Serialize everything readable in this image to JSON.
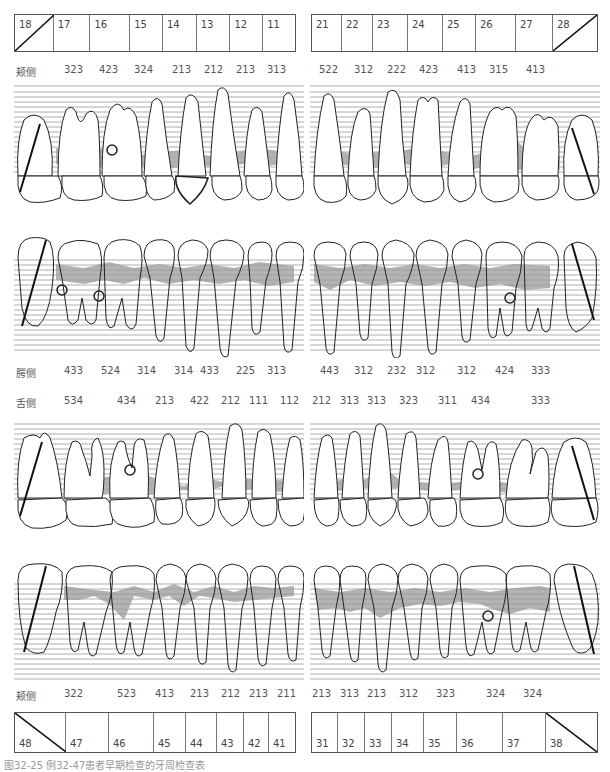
{
  "upper_tooth_numbers": {
    "right": [
      "18",
      "17",
      "16",
      "15",
      "14",
      "13",
      "12",
      "11"
    ],
    "left": [
      "21",
      "22",
      "23",
      "24",
      "25",
      "26",
      "27",
      "28"
    ],
    "missing": [
      "18",
      "28"
    ]
  },
  "lower_tooth_numbers": {
    "right": [
      "48",
      "47",
      "46",
      "45",
      "44",
      "43",
      "42",
      "41"
    ],
    "left": [
      "31",
      "32",
      "33",
      "34",
      "35",
      "36",
      "37",
      "38"
    ],
    "missing": [
      "48",
      "38"
    ]
  },
  "rows": {
    "upper_buccal": {
      "label": "颊侧",
      "right": [
        "323",
        "423",
        "324",
        "213",
        "212",
        "213",
        "313"
      ],
      "left": [
        "522",
        "312",
        "222",
        "423",
        "413",
        "315",
        "413"
      ]
    },
    "upper_palatal": {
      "label": "腭侧",
      "right": [
        "433",
        "524",
        "314",
        "314",
        "433",
        "225",
        "313"
      ],
      "left": [
        "443",
        "312",
        "232",
        "312",
        "312",
        "424",
        "333"
      ]
    },
    "lower_lingual": {
      "label": "舌侧",
      "right": [
        "534",
        "434",
        "213",
        "422",
        "212",
        "111",
        "112"
      ],
      "left": [
        "212",
        "313",
        "313",
        "323",
        "311",
        "434",
        "333"
      ]
    },
    "lower_buccal": {
      "label": "颊侧",
      "right": [
        "322",
        "523",
        "413",
        "213",
        "212",
        "213",
        "211"
      ],
      "left": [
        "213",
        "313",
        "213",
        "312",
        "323",
        "324",
        "324"
      ]
    }
  },
  "colors": {
    "pocket_band": "#a6a6a6",
    "grid_line": "#9a9a9a",
    "outline": "#222222"
  },
  "caption": "图32-25 例32-47患者早期检查的牙周检查表"
}
